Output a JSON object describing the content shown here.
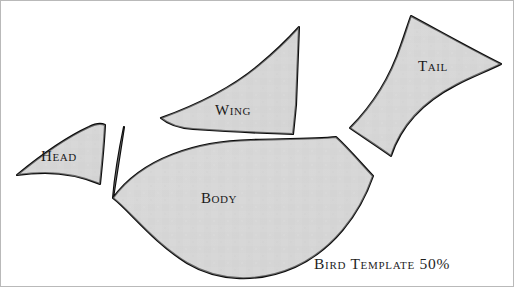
{
  "figure": {
    "title": "Bird Template",
    "width": 514,
    "height": 287,
    "background_color": "#ffffff",
    "border_color": "#b9b9b9",
    "caption": "Bird Template 50%"
  },
  "style": {
    "piece_fill": "#d7d7d7",
    "piece_outline": "#0b0b0b",
    "label_color": "#1a1a1a"
  },
  "pieces": [
    {
      "id": "head",
      "label": "Head",
      "label_x": 58,
      "label_y": 160,
      "path": "M 16 174 C 38 156 66 136 88 126 C 94 123 100 122 104 124 C 103 144 101 164 99 183 C 82 176 62 172 44 172 C 33 172 23 173 16 174 Z"
    },
    {
      "id": "wing",
      "label": "Wing",
      "label_x": 232,
      "label_y": 114,
      "path": "M 160 117 C 196 104 232 86 258 64 C 275 50 288 37 298 26 C 297 52 296 80 295 104 C 294 114 293 125 292 133 C 258 132 222 130 192 128 C 178 127 167 123 160 117 Z"
    },
    {
      "id": "body",
      "label": "Body",
      "label_x": 218,
      "label_y": 202,
      "path": "M 123 126 C 118 150 114 174 112 197 C 141 157 196 140 250 139 C 285 138 316 138 335 136 C 346 146 358 160 372 175 C 358 215 331 249 294 266 C 258 282 218 281 186 262 C 152 241 128 209 112 197 Z"
    },
    {
      "id": "tail",
      "label": "Tail",
      "label_x": 432,
      "label_y": 70,
      "path": "M 410 15 C 438 30 470 48 500 63 C 486 70 470 76 455 84 C 424 100 400 124 390 155 C 376 145 362 136 349 127 C 372 104 390 74 400 44 C 404 33 407 23 410 15 Z"
    }
  ]
}
